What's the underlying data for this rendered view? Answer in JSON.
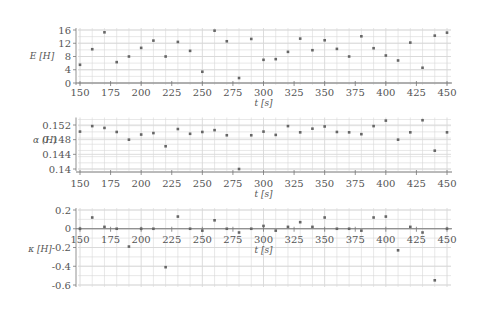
{
  "chart_data": [
    {
      "type": "scatter",
      "title": "",
      "xlabel": "t [s]",
      "ylabel": "E [H]",
      "xlim": [
        150,
        450
      ],
      "ylim": [
        0,
        16
      ],
      "xticks": [
        150,
        175,
        200,
        225,
        250,
        275,
        300,
        325,
        350,
        375,
        400,
        425,
        450
      ],
      "yticks": [
        0,
        4,
        8,
        12,
        16
      ],
      "grid": true,
      "x": [
        150,
        160,
        170,
        180,
        190,
        200,
        210,
        220,
        230,
        240,
        250,
        260,
        270,
        280,
        290,
        300,
        310,
        320,
        330,
        340,
        350,
        360,
        370,
        380,
        390,
        400,
        410,
        420,
        430,
        440,
        450
      ],
      "values": [
        5.5,
        10.2,
        15.3,
        6.3,
        8.0,
        10.6,
        12.8,
        8.0,
        12.4,
        9.7,
        3.4,
        15.8,
        12.6,
        1.5,
        13.3,
        7.0,
        7.2,
        9.4,
        13.4,
        9.9,
        12.9,
        10.3,
        8.0,
        14.1,
        10.5,
        8.3,
        6.8,
        12.2,
        4.6,
        14.3,
        15.2
      ]
    },
    {
      "type": "scatter",
      "title": "",
      "xlabel": "t [s]",
      "ylabel": "α (H)",
      "xlim": [
        150,
        450
      ],
      "ylim": [
        0.14,
        0.1535
      ],
      "xticks": [
        150,
        175,
        200,
        225,
        250,
        275,
        300,
        325,
        350,
        375,
        400,
        425,
        450
      ],
      "yticks": [
        0.14,
        0.144,
        0.148,
        0.152
      ],
      "grid": true,
      "x": [
        150,
        160,
        170,
        180,
        190,
        200,
        210,
        220,
        230,
        240,
        250,
        260,
        270,
        280,
        290,
        300,
        310,
        320,
        330,
        340,
        350,
        360,
        370,
        380,
        390,
        400,
        410,
        420,
        430,
        440,
        450
      ],
      "values": [
        0.1502,
        0.1517,
        0.1512,
        0.1501,
        0.148,
        0.1494,
        0.1498,
        0.1462,
        0.1509,
        0.1496,
        0.1501,
        0.1506,
        0.1492,
        0.14,
        0.1492,
        0.1502,
        0.1493,
        0.1517,
        0.15,
        0.151,
        0.1516,
        0.1501,
        0.15,
        0.1495,
        0.1517,
        0.1532,
        0.148,
        0.15,
        0.1533,
        0.145,
        0.15
      ]
    },
    {
      "type": "scatter",
      "title": "",
      "xlabel": "t [s]",
      "ylabel": "κ [H]",
      "xlim": [
        150,
        450
      ],
      "ylim": [
        -0.6,
        0.2
      ],
      "xticks": [
        150,
        175,
        200,
        225,
        250,
        275,
        300,
        325,
        350,
        375,
        400,
        425,
        450
      ],
      "yticks": [
        -0.6,
        -0.4,
        -0.2,
        0,
        0.2
      ],
      "grid": true,
      "x": [
        150,
        160,
        170,
        180,
        190,
        200,
        210,
        220,
        230,
        240,
        250,
        260,
        270,
        280,
        290,
        300,
        310,
        320,
        330,
        340,
        350,
        360,
        370,
        380,
        390,
        400,
        410,
        420,
        430,
        440,
        450
      ],
      "values": [
        0,
        0.12,
        0.02,
        0,
        -0.19,
        0,
        0,
        -0.41,
        0.13,
        0,
        -0.02,
        0.09,
        0,
        -0.04,
        0,
        0.03,
        -0.02,
        0.02,
        0.07,
        0.02,
        0.12,
        0,
        0,
        -0.02,
        0.12,
        0.13,
        -0.23,
        0.02,
        -0.04,
        -0.55,
        0
      ]
    }
  ],
  "panels": [
    {
      "ylabel": "E [H]",
      "xlabel": "t [s]",
      "ytick_labels": [
        "16",
        "12",
        "8",
        "4",
        "0"
      ],
      "xtick_labels": [
        "150",
        "175",
        "200",
        "225",
        "250",
        "275",
        "300",
        "325",
        "350",
        "375",
        "400",
        "425",
        "450"
      ]
    },
    {
      "ylabel": "α (H)",
      "xlabel": "t [s]",
      "ytick_labels": [
        "0.152",
        "0.148",
        "0.144",
        "0.14"
      ],
      "xtick_labels": [
        "150",
        "175",
        "200",
        "225",
        "250",
        "275",
        "300",
        "325",
        "350",
        "375",
        "400",
        "425",
        "450"
      ]
    },
    {
      "ylabel": "κ [H]",
      "xlabel": "t [s]",
      "ytick_labels": [
        "0.2",
        "0",
        "-0.2",
        "-0.4",
        "-0.6"
      ],
      "xtick_labels": [
        "150",
        "175",
        "200",
        "225",
        "250",
        "275",
        "300",
        "325",
        "350",
        "375",
        "400",
        "425",
        "450"
      ]
    }
  ],
  "colors": {
    "grid": "#d8d8d8",
    "axis": "#777777",
    "marker": "#666666",
    "text": "#555555"
  }
}
